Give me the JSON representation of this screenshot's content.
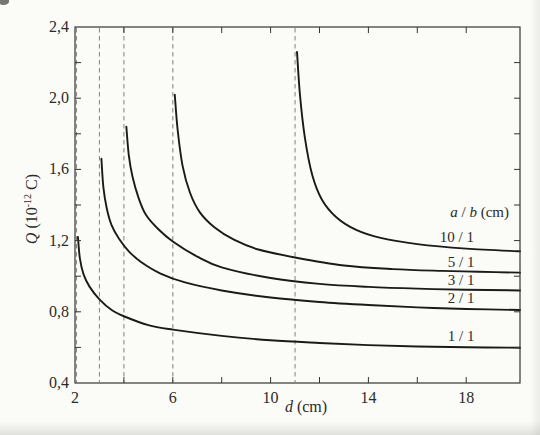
{
  "style": {
    "background": "#fbfbf8",
    "frame_color": "#343432",
    "curve_color": "#1a1a18",
    "dash_color": "#8c8c88",
    "text_color": "#2b2b29"
  },
  "chart_data": {
    "type": "line",
    "title": "",
    "xlabel": "d (cm)",
    "ylabel": "Q (10⁻¹² C)",
    "xlabel_parts": {
      "sym": "d",
      "rest": " (cm)"
    },
    "ylabel_parts": {
      "sym": "Q",
      "open": " (10",
      "exp": "-12",
      "close": " C)"
    },
    "xlim": [
      2,
      20.2
    ],
    "ylim": [
      0.4,
      2.4
    ],
    "grid": "off",
    "x_ticks": [
      4,
      6,
      8,
      10,
      12,
      14,
      16,
      18
    ],
    "x_tick_labels": [
      {
        "value": 2,
        "label": "2"
      },
      {
        "value": 6,
        "label": "6"
      },
      {
        "value": 10,
        "label": "10"
      },
      {
        "value": 14,
        "label": "14"
      },
      {
        "value": 18,
        "label": "18"
      }
    ],
    "y_ticks": [
      0.6,
      0.8,
      1.0,
      1.2,
      1.4,
      1.6,
      1.8,
      2.0,
      2.2
    ],
    "y_tick_labels": [
      {
        "value": 2.4,
        "label": "2,4"
      },
      {
        "value": 2.0,
        "label": "2,0"
      },
      {
        "value": 1.6,
        "label": "1,6"
      },
      {
        "value": 1.2,
        "label": "1,2"
      },
      {
        "value": 0.8,
        "label": "0,8"
      },
      {
        "value": 0.4,
        "label": "0,4"
      }
    ],
    "legend_title": "a / b (cm)",
    "dashed_asymptotes_d": [
      2.06,
      3,
      4,
      6,
      11
    ],
    "series": [
      {
        "name": "1 / 1",
        "points": [
          [
            2.12,
            1.22
          ],
          [
            2.2,
            1.1
          ],
          [
            2.35,
            1.01
          ],
          [
            2.6,
            0.94
          ],
          [
            3.0,
            0.87
          ],
          [
            3.5,
            0.81
          ],
          [
            4,
            0.775
          ],
          [
            5,
            0.725
          ],
          [
            6,
            0.7
          ],
          [
            8,
            0.665
          ],
          [
            10,
            0.64
          ],
          [
            12,
            0.625
          ],
          [
            14,
            0.613
          ],
          [
            16,
            0.605
          ],
          [
            18,
            0.601
          ],
          [
            20.2,
            0.598
          ]
        ]
      },
      {
        "name": "2 / 1",
        "points": [
          [
            3.08,
            1.66
          ],
          [
            3.16,
            1.5
          ],
          [
            3.3,
            1.38
          ],
          [
            3.5,
            1.285
          ],
          [
            3.8,
            1.21
          ],
          [
            4.2,
            1.14
          ],
          [
            4.7,
            1.08
          ],
          [
            5.5,
            1.015
          ],
          [
            6.5,
            0.965
          ],
          [
            8,
            0.92
          ],
          [
            10,
            0.88
          ],
          [
            12,
            0.855
          ],
          [
            14,
            0.838
          ],
          [
            16,
            0.825
          ],
          [
            18,
            0.816
          ],
          [
            20.2,
            0.81
          ]
        ]
      },
      {
        "name": "3 / 1",
        "points": [
          [
            4.1,
            1.84
          ],
          [
            4.2,
            1.68
          ],
          [
            4.35,
            1.56
          ],
          [
            4.6,
            1.44
          ],
          [
            4.9,
            1.345
          ],
          [
            5.4,
            1.265
          ],
          [
            6,
            1.195
          ],
          [
            7,
            1.11
          ],
          [
            8,
            1.05
          ],
          [
            10,
            0.99
          ],
          [
            12,
            0.957
          ],
          [
            14,
            0.94
          ],
          [
            16,
            0.93
          ],
          [
            18,
            0.924
          ],
          [
            20.2,
            0.92
          ]
        ]
      },
      {
        "name": "5 / 1",
        "points": [
          [
            6.08,
            2.02
          ],
          [
            6.2,
            1.82
          ],
          [
            6.4,
            1.62
          ],
          [
            6.7,
            1.47
          ],
          [
            7.1,
            1.36
          ],
          [
            7.7,
            1.275
          ],
          [
            8.5,
            1.205
          ],
          [
            9.5,
            1.15
          ],
          [
            11,
            1.105
          ],
          [
            13,
            1.06
          ],
          [
            15,
            1.04
          ],
          [
            17,
            1.03
          ],
          [
            18.5,
            1.025
          ],
          [
            20.2,
            1.02
          ]
        ]
      },
      {
        "name": "10 / 1",
        "points": [
          [
            11.08,
            2.26
          ],
          [
            11.2,
            2.02
          ],
          [
            11.4,
            1.78
          ],
          [
            11.7,
            1.57
          ],
          [
            12.1,
            1.43
          ],
          [
            12.7,
            1.33
          ],
          [
            13.5,
            1.26
          ],
          [
            14.5,
            1.215
          ],
          [
            16,
            1.18
          ],
          [
            18,
            1.155
          ],
          [
            20.2,
            1.14
          ]
        ]
      }
    ],
    "annotations": [
      {
        "name": "legend-title",
        "text": "a / b (cm)",
        "parts": [
          [
            "a",
            1
          ],
          [
            " / ",
            0
          ],
          [
            "b",
            1
          ],
          [
            " (cm)",
            0
          ]
        ],
        "d": 18.55,
        "q": 1.36
      },
      {
        "name": "label-10-1",
        "text": "10 / 1",
        "parts": [
          [
            "10 / 1",
            0
          ]
        ],
        "d": 17.62,
        "q": 1.22
      },
      {
        "name": "label-5-1",
        "text": "5 / 1",
        "parts": [
          [
            "5 / 1",
            0
          ]
        ],
        "d": 17.79,
        "q": 1.08
      },
      {
        "name": "label-3-1",
        "text": "3 / 1",
        "parts": [
          [
            "3 / 1",
            0
          ]
        ],
        "d": 17.79,
        "q": 0.978
      },
      {
        "name": "label-2-1",
        "text": "2 / 1",
        "parts": [
          [
            "2 / 1",
            0
          ]
        ],
        "d": 17.79,
        "q": 0.877
      },
      {
        "name": "label-1-1",
        "text": "1 / 1",
        "parts": [
          [
            "1 / 1",
            0
          ]
        ],
        "d": 17.79,
        "q": 0.664
      }
    ]
  }
}
